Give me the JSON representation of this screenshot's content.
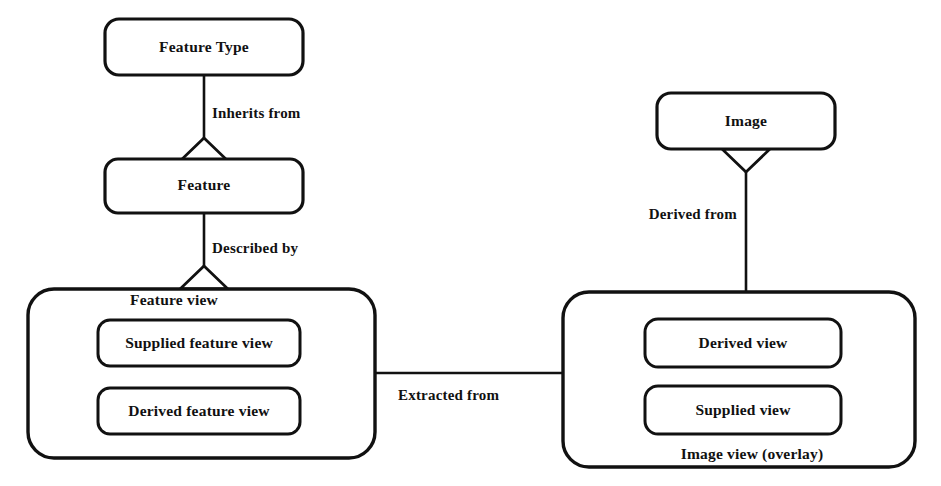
{
  "diagram": {
    "background_color": "#ffffff",
    "line_color": "#111111",
    "nodes": {
      "feature_type": {
        "label": "Feature Type"
      },
      "feature": {
        "label": "Feature"
      },
      "feature_view_group": {
        "label": "Feature view"
      },
      "supplied_feature_view": {
        "label": "Supplied feature view"
      },
      "derived_feature_view": {
        "label": "Derived feature view"
      },
      "image": {
        "label": "Image"
      },
      "image_view_group": {
        "label": "Image view (overlay)"
      },
      "derived_view": {
        "label": "Derived view"
      },
      "supplied_view": {
        "label": "Supplied view"
      }
    },
    "relationships": {
      "inherits_from": {
        "label": "Inherits from"
      },
      "described_by": {
        "label": "Described by"
      },
      "derived_from": {
        "label": "Derived from"
      },
      "extracted_from": {
        "label": "Extracted from"
      }
    }
  }
}
